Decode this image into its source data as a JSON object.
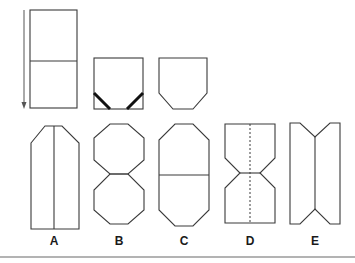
{
  "diagram": {
    "type": "paper-folding-question",
    "step_sequence": {
      "steps": [
        {
          "id": "step-1",
          "description": "unfolded rectangle with horizontal fold line"
        },
        {
          "id": "step-2",
          "description": "folded square with diagonal corner folds (bold lines)"
        },
        {
          "id": "step-3",
          "description": "square with folded-in bottom corners"
        }
      ],
      "arrow_direction": "down"
    },
    "options": [
      {
        "id": "A",
        "label": "A",
        "description": "tall rectangle with chamfered top corners and vertical center line"
      },
      {
        "id": "B",
        "label": "B",
        "description": "two stacked octagons"
      },
      {
        "id": "C",
        "label": "C",
        "description": "elongated octagon with horizontal center line"
      },
      {
        "id": "D",
        "label": "D",
        "description": "hourglass shape with dashed vertical center line"
      },
      {
        "id": "E",
        "label": "E",
        "description": "rectangle with V-notches top and bottom and vertical center line"
      }
    ],
    "colors": {
      "stroke": "#3a3a3a",
      "bold_stroke": "#111111",
      "rule": "#9a9a9a",
      "background": "#ffffff"
    }
  }
}
